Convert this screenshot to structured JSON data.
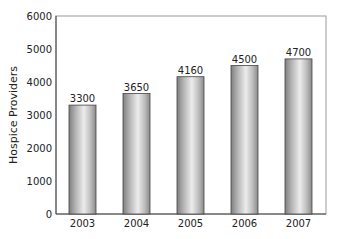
{
  "chart_data": {
    "type": "bar",
    "title": "",
    "xlabel": "",
    "ylabel": "Hospice Providers",
    "categories": [
      "2003",
      "2004",
      "2005",
      "2006",
      "2007"
    ],
    "values": [
      3300,
      3650,
      4160,
      4500,
      4700
    ],
    "data_labels": [
      "3300",
      "3650",
      "4160",
      "4500",
      "4700"
    ],
    "ylim": [
      0,
      6000
    ],
    "yticks": [
      0,
      1000,
      2000,
      3000,
      4000,
      5000,
      6000
    ],
    "ytick_labels": [
      "0",
      "1000",
      "2000",
      "3000",
      "4000",
      "5000",
      "6000"
    ],
    "grid": false,
    "legend": null,
    "bar_style": "cylindrical gray gradient",
    "colors": {
      "bar_dark": "#8a8a8a",
      "bar_light": "#e6e6e6",
      "axis": "#555555",
      "frame": "#aaaaaa"
    }
  }
}
